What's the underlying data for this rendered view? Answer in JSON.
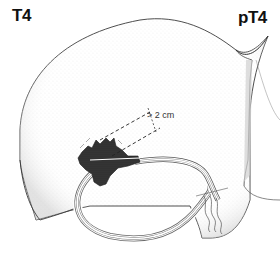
{
  "figure": {
    "labels": {
      "left_stage": "T4",
      "right_stage": "pT4",
      "measurement": "> 2 cm"
    },
    "colors": {
      "outline": "#3a3a3a",
      "stipple": "#b8b8b8",
      "tumor": "#1e1e1e",
      "background": "#ffffff"
    }
  }
}
